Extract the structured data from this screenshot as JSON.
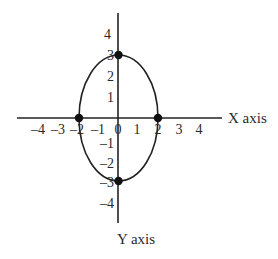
{
  "diagram": {
    "type": "ellipse-on-axes",
    "equation_implied": "x^2/4 + y^2/9 = 1",
    "x_axis_label": "X axis",
    "y_axis_label": "Y axis",
    "x_ticks": [
      "–4",
      "–3",
      "–2",
      "–1",
      "0",
      "1",
      "2",
      "3",
      "4"
    ],
    "x_tick_values": [
      -4,
      -3,
      -2,
      -1,
      0,
      1,
      2,
      3,
      4
    ],
    "y_ticks_positive": [
      "4",
      "3",
      "2",
      "1"
    ],
    "y_tick_values_positive": [
      4,
      3,
      2,
      1
    ],
    "y_ticks_negative": [
      "–1",
      "–2",
      "–3",
      "–4"
    ],
    "y_tick_values_negative": [
      -1,
      -2,
      -3,
      -4
    ],
    "points": [
      {
        "x": 0,
        "y": 3
      },
      {
        "x": 0,
        "y": -3
      },
      {
        "x": -2,
        "y": 0
      },
      {
        "x": 2,
        "y": 0
      }
    ],
    "ellipse": {
      "center": [
        0,
        0
      ],
      "semi_axis_x": 2,
      "semi_axis_y": 3
    },
    "colors": {
      "line": "#222222",
      "text": "#2a2a2a",
      "background": "#ffffff"
    }
  }
}
